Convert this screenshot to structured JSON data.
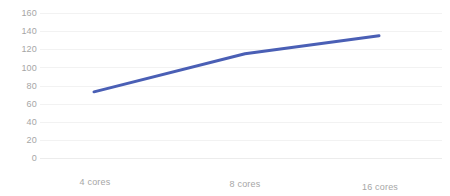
{
  "chart_data": {
    "type": "line",
    "title": "",
    "subtitle": "",
    "xlabel": "",
    "ylabel": "",
    "categories": [
      "4 cores",
      "8 cores",
      "16 cores"
    ],
    "series": [
      {
        "name": "",
        "values": [
          73,
          115,
          135
        ],
        "color": "#4A5FB5"
      }
    ],
    "ylim": [
      0,
      160
    ],
    "yticks": [
      0,
      20,
      40,
      60,
      80,
      100,
      120,
      140,
      160
    ],
    "ytick_labels": [
      "0",
      "20",
      "40",
      "60",
      "80",
      "100",
      "120",
      "140",
      "160"
    ],
    "grid": true,
    "grid_axis": "y",
    "grid_color": "#F2F2F2",
    "legend": false,
    "legend_position": "none",
    "background_color": "#FFFFFF",
    "tick_label_color": "#A6A6A6",
    "line_width": 3,
    "markers": false,
    "annotations": []
  }
}
